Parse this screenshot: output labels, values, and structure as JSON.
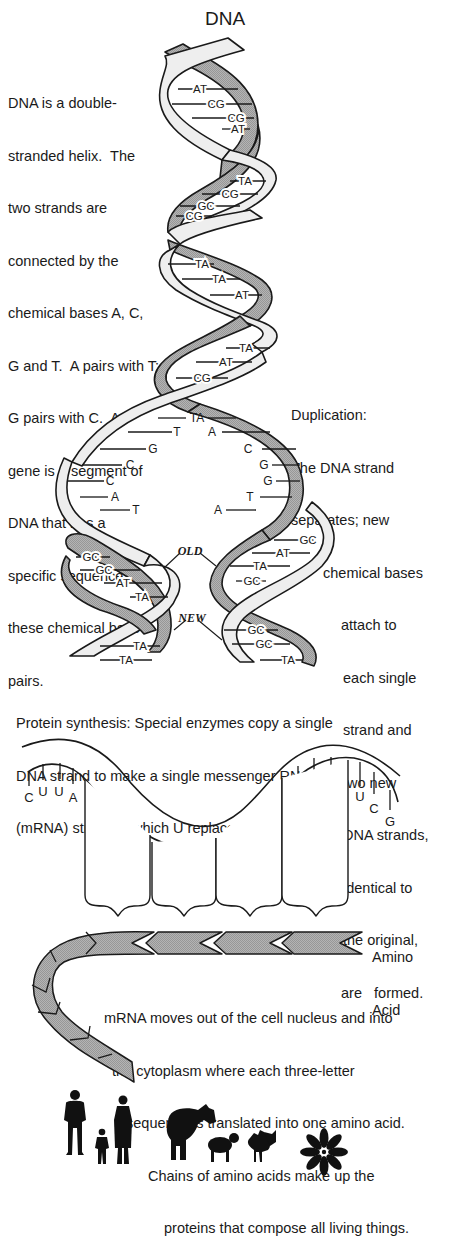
{
  "title": "DNA",
  "intro_text": [
    "DNA is a double-",
    "stranded helix.  The",
    "two strands are",
    "connected by the",
    "chemical bases A, C,",
    "G and T.  A pairs with T;",
    "G pairs with C.  A",
    "gene is a segment of",
    "DNA that has a",
    "specific sequence of",
    "these chemical base",
    "pairs."
  ],
  "duplication_text": [
    "Duplication:",
    "The DNA strand",
    "separates; new",
    "chemical bases",
    "attach to",
    "each single",
    "strand and",
    "two new",
    "DNA strands,",
    "identical to",
    "the original,",
    "are   formed."
  ],
  "helix": {
    "upper_pairs": [
      "AT",
      "CG",
      "CG",
      "AT",
      "TA",
      "CG",
      "GC",
      "CG",
      "TA",
      "TA",
      "AT",
      "TA",
      "AT",
      "CG"
    ],
    "split_pairs_top": "TA",
    "split_left_bases": [
      "T",
      "G",
      "C",
      "C",
      "A",
      "T"
    ],
    "split_right_bases": [
      "A",
      "C",
      "G",
      "G",
      "T",
      "A"
    ],
    "left_lower_pairs": [
      "GC",
      "GC",
      "AT",
      "TA",
      "TA",
      "TA"
    ],
    "right_lower_pairs": [
      "GC",
      "AT",
      "TA",
      "GC",
      "GC",
      "GC",
      "TA"
    ],
    "label_old": "OLD",
    "label_new": "NEW"
  },
  "protein_text": [
    "Protein synthesis: Special enzymes copy a single",
    "DNA strand to make a single messenger RNA",
    "(mRNA) strand in which U replaces T as a base."
  ],
  "mrna": {
    "codons": [
      [
        "C",
        "U",
        "U",
        "A"
      ],
      [
        "G",
        "G",
        "C"
      ],
      [
        "A",
        "U",
        "U"
      ],
      [
        "C",
        "C",
        "G"
      ],
      [
        "A",
        "G",
        "U"
      ],
      [
        "U",
        "C",
        "G"
      ]
    ]
  },
  "amino_label": [
    "Amino",
    "Acid"
  ],
  "translation_text": [
    "mRNA moves out of the cell nucleus and into",
    "the cytoplasm where each three-letter",
    "sequence is translated into one amino acid.",
    "Chains of amino acids make up the",
    "proteins that compose all living things."
  ],
  "organisms": [
    "man-silhouette",
    "child-silhouette",
    "woman-silhouette",
    "cow-silhouette",
    "sheep-silhouette",
    "rooster-silhouette",
    "flower-silhouette"
  ],
  "colors": {
    "dark_strand": "#a9a9a9",
    "light_strand": "#eeeeee",
    "outline": "#1a1a1a",
    "background": "#ffffff"
  }
}
